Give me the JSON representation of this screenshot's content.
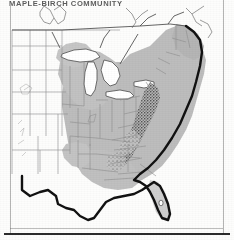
{
  "figure": {
    "title": "MAPLE-BIRCH COMMUNITY",
    "kind": "vegetation-range-map",
    "region": "Eastern United States",
    "projection_note": "conterminous United States, state outlines"
  },
  "colors": {
    "paper": "#fdfdfc",
    "ink": "#1a1a1a",
    "range_fill": "#b9b9b9",
    "range_fill_light": "#c9c9c9",
    "lake_fill": "#ffffff",
    "state_line": "#8c8c8c",
    "coast_heavy": "#121212",
    "stipple": "#2d2d2d",
    "rule": "#5d5d5d"
  },
  "legend": {
    "range_label": "shaded area = community range",
    "heavy_outline_label": "heavy line = southern / western limit",
    "stipple_label": "dense stipple = Appalachian highland extension"
  },
  "map_features": {
    "lakes": [
      "Lake Superior",
      "Lake Michigan",
      "Lake Huron",
      "Lake Erie",
      "Lake Ontario"
    ],
    "shaded_states": [
      "Maine",
      "New Hampshire",
      "Vermont",
      "Massachusetts",
      "Rhode Island",
      "Connecticut",
      "New York",
      "New Jersey",
      "Pennsylvania",
      "Delaware",
      "Maryland",
      "West Virginia",
      "Virginia",
      "North Carolina",
      "South Carolina",
      "Georgia",
      "Florida",
      "Alabama",
      "Mississippi",
      "Tennessee",
      "Kentucky",
      "Ohio",
      "Indiana",
      "Illinois",
      "Michigan",
      "Wisconsin",
      "Minnesota",
      "Iowa",
      "Missouri",
      "Arkansas",
      "Louisiana"
    ],
    "unshaded_states": [
      "Washington",
      "Oregon",
      "California",
      "Idaho",
      "Nevada",
      "Utah",
      "Arizona",
      "Montana",
      "Wyoming",
      "Colorado",
      "New Mexico",
      "North Dakota",
      "South Dakota",
      "Nebraska",
      "Kansas",
      "Oklahoma",
      "Texas"
    ]
  },
  "page": {
    "rule_left": true,
    "rule_right": true,
    "rule_bottom": true
  }
}
